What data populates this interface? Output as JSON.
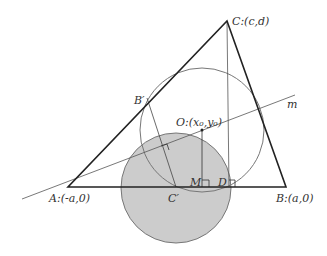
{
  "diagram": {
    "type": "geometry",
    "labels": {
      "A": "A:(-a,0)",
      "B": "B:(a,0)",
      "C": "C:(c,d)",
      "B_prime": "B′",
      "C_prime": "C′",
      "O": "O:(x₀,y₀)",
      "M": "M",
      "D": "D",
      "m": "m"
    },
    "points": {
      "A": [
        68,
        187
      ],
      "B": [
        286,
        187
      ],
      "C": [
        227,
        21
      ],
      "B_prime": [
        147,
        98
      ],
      "C_prime": [
        176,
        187
      ],
      "O": [
        202,
        130
      ],
      "M": [
        202,
        187
      ],
      "D": [
        229,
        187
      ]
    },
    "circles": [
      {
        "name": "shaded-circle",
        "cx": 176,
        "cy": 188,
        "r": 55,
        "fill": "#cccccc"
      },
      {
        "name": "circumcircle",
        "cx": 202,
        "cy": 130,
        "r": 62,
        "fill": "none"
      }
    ],
    "line_m": {
      "from": [
        22,
        199
      ],
      "to": [
        295,
        95
      ]
    },
    "colors": {
      "stroke": "#333333",
      "circle_stroke": "#777777",
      "shade": "#cccccc"
    }
  }
}
